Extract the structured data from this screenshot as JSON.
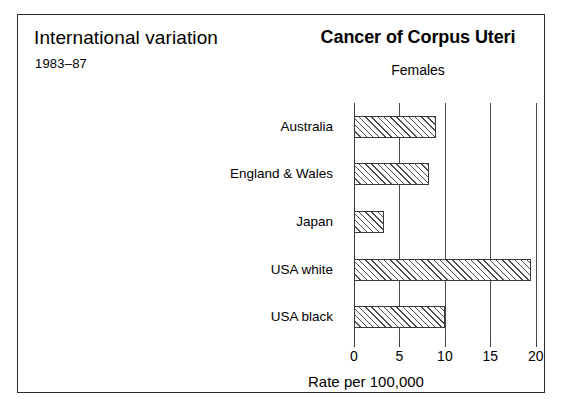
{
  "panel": {
    "title": "International variation",
    "subtitle": "1983–87"
  },
  "chart_data": {
    "type": "bar",
    "orientation": "horizontal",
    "title": "Cancer of Corpus Uteri",
    "subtitle": "Females",
    "xlabel": "Rate per 100,000",
    "ylabel": "",
    "categories": [
      "Australia",
      "England & Wales",
      "Japan",
      "USA white",
      "USA black"
    ],
    "values": [
      9.0,
      8.3,
      3.3,
      19.5,
      10.0
    ],
    "xlim": [
      0,
      22
    ],
    "xticks": [
      0,
      5,
      10,
      15,
      20
    ],
    "xtick_labels": [
      "0",
      "5",
      "10",
      "15",
      "20"
    ],
    "grid": "vertical-at-ticks",
    "legend": "none",
    "bar_fill": "diagonal-hatch",
    "colors": {
      "frame": "#2b2b2b",
      "axis": "#3a3a3a",
      "grid": "#4a4a4a",
      "hatch": "#4d4d4d",
      "background": "#ffffff"
    }
  }
}
